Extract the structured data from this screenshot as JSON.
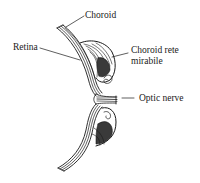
{
  "diagram": {
    "type": "anatomical line drawing",
    "labels": {
      "choroid": "Choroid",
      "retina": "Retina",
      "choroid_rete_line1": "Choroid rete",
      "choroid_rete_line2": "mirabile",
      "optic_nerve": "Optic nerve"
    },
    "colors": {
      "ink": "#1a1a1a",
      "background": "#ffffff"
    }
  }
}
